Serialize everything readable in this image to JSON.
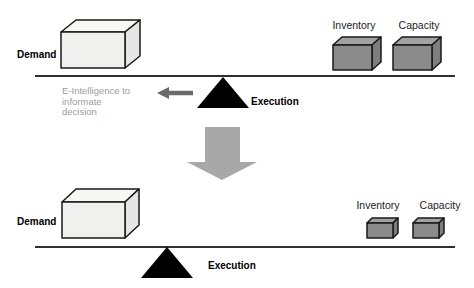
{
  "diagram": {
    "top": {
      "demand_label": "Demand",
      "inventory_label": "Inventory",
      "capacity_label": "Capacity",
      "execution_label": "Execution",
      "note_lines": [
        "E-Intelligence to",
        "informate",
        "decision"
      ]
    },
    "bottom": {
      "demand_label": "Demand",
      "inventory_label": "Inventory",
      "capacity_label": "Capacity",
      "execution_label": "Execution"
    }
  },
  "colors": {
    "background": "#ffffff",
    "light_box_top": "#f7f7f5",
    "light_box_front": "#f0f0ee",
    "light_box_side": "#e6e6e4",
    "gray_box_top": "#a2a2a2",
    "gray_box_front": "#8b8b8b",
    "gray_box_side": "#7e7e7e",
    "outline": "#1a1a1a",
    "beam_line": "#2f2f2f",
    "fulcrum_black": "#000000",
    "down_arrow_gray": "#a8a8a8",
    "left_arrow_gray": "#6b6b6b",
    "note_gray": "#9b9b9b",
    "label_black": "#000000"
  }
}
